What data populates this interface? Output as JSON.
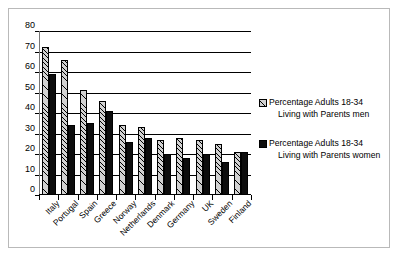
{
  "chart_data": {
    "type": "bar",
    "title": "",
    "xlabel": "",
    "ylabel": "",
    "ylim": [
      0,
      80
    ],
    "yticks": [
      0,
      10,
      20,
      30,
      40,
      50,
      60,
      70,
      80
    ],
    "grid": true,
    "legend_position": "right",
    "categories": [
      "Italy",
      "Portugal",
      "Spain",
      "Greece",
      "Norway",
      "Netherlands",
      "Denmark",
      "Germany",
      "UK",
      "Sweden",
      "Finland"
    ],
    "series": [
      {
        "name": "Percentage Adults 18-34 Living with Parents   men",
        "name_line1": "Percentage Adults 18-34",
        "name_line2": "Living with Parents   men",
        "swatch": "hatched-light-grey",
        "color": "#d2d2d2",
        "values": [
          72,
          66,
          51,
          46,
          34,
          33,
          27,
          28,
          27,
          25,
          21
        ]
      },
      {
        "name": "Percentage Adults 18-34 Living with Parents   women",
        "name_line1": "Percentage Adults 18-34",
        "name_line2": "Living with Parents   women",
        "swatch": "solid-black",
        "color": "#0d0d0d",
        "values": [
          59,
          34,
          35,
          41,
          26,
          28,
          20,
          18,
          20,
          16,
          21
        ]
      }
    ]
  }
}
